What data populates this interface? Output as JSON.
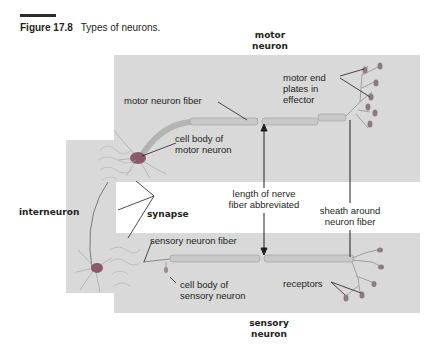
{
  "figure": {
    "number": "Figure 17.8",
    "caption": "Types of neurons."
  },
  "titles": {
    "motor_line1": "motor",
    "motor_line2": "neuron",
    "sensory_line1": "sensory",
    "sensory_line2": "neuron",
    "interneuron": "interneuron"
  },
  "labels": {
    "motor_end_1": "motor end",
    "motor_end_2": "plates in",
    "motor_end_3": "effector",
    "motor_fiber": "motor neuron fiber",
    "cell_body_motor_1": "cell body of",
    "cell_body_motor_2": "motor neuron",
    "length_1": "length of nerve",
    "length_2": "fiber abbreviated",
    "synapse": "synapse",
    "sheath_1": "sheath around",
    "sheath_2": "neuron fiber",
    "sensory_fiber": "sensory neuron fiber",
    "cell_body_sensory_1": "cell body of",
    "cell_body_sensory_2": "sensory neuron",
    "receptors": "receptors"
  },
  "colors": {
    "panel": "#d9d9d9",
    "cell_body": "#8a5a6a",
    "fiber": "#bfbfbf",
    "end_plate": "#8c7b86"
  }
}
